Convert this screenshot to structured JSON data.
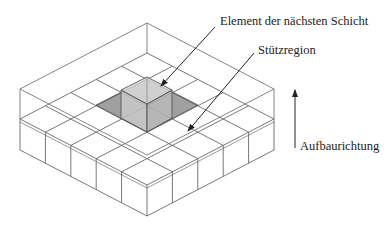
{
  "labels": {
    "next_layer_element": "Element der nächsten Schicht",
    "support_region": "Stützregion",
    "build_direction": "Aufbaurichtung"
  },
  "colors": {
    "line": "#555555",
    "shade": "#9a9a9a",
    "cube_fill": "#c8c8c8",
    "arrow": "#222222"
  }
}
